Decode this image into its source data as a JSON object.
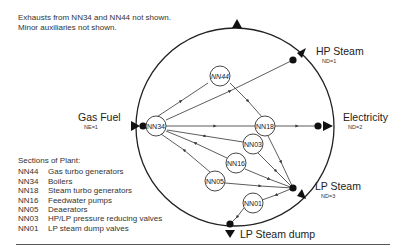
{
  "notes": {
    "line1": "Exhausts from NN34 and NN44 not shown.",
    "line2": "Minor auxiliaries not shown."
  },
  "legend": {
    "title": "Sections of Plant:",
    "items": [
      {
        "code": "NN44",
        "desc": "Gas turbo generators"
      },
      {
        "code": "NN34",
        "desc": "Boilers"
      },
      {
        "code": "NN18",
        "desc": "Steam turbo generators"
      },
      {
        "code": "NN16",
        "desc": "Feedwater pumps"
      },
      {
        "code": "NN05",
        "desc": "Deaerators"
      },
      {
        "code": "NN03",
        "desc": "HP/LP pressure reducing valves"
      },
      {
        "code": "NN01",
        "desc": "LP steam dump valves"
      }
    ]
  },
  "boundary": {
    "inputs": [
      {
        "label": "Gas Fuel",
        "sub": "NE=1"
      }
    ],
    "outputs": [
      {
        "label": "HP Steam",
        "sub": "ND=1"
      },
      {
        "label": "Electricity",
        "sub": "ND=2"
      },
      {
        "label": "LP Steam",
        "sub": "ND=3"
      },
      {
        "label": "LP Steam dump",
        "sub": ""
      }
    ]
  },
  "nodes": {
    "nn44": "NN44",
    "nn34": "NN34",
    "nn18": "NN18",
    "nn03": "NN03",
    "nn16": "NN16",
    "nn05": "NN05",
    "nn01": "NN01"
  },
  "colors": {
    "line": "#333333",
    "background": "#ffffff"
  }
}
